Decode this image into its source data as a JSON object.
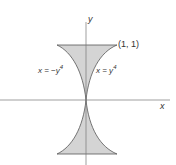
{
  "figure": {
    "axis_x_label": "x",
    "axis_y_label": "y",
    "point_label": "(1, 1)",
    "curve_left_label": "x = −y",
    "curve_left_exp": "4",
    "curve_right_label": "x = y",
    "curve_right_exp": "4",
    "fill_color": "#d4d4d4",
    "stroke_color": "#555555"
  }
}
